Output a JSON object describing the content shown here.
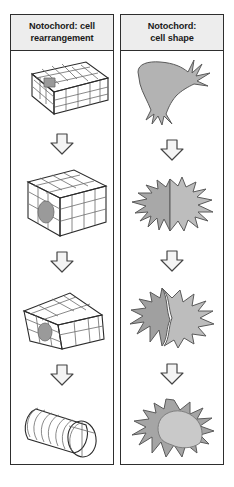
{
  "figure": {
    "background_color": "#ffffff",
    "border_color": "#2e2e2e",
    "header_fill": "#ededed"
  },
  "panels": [
    {
      "id": "cell-rearrangement",
      "header_line1": "Notochord: cell",
      "header_line2": "rearrangement",
      "stages": [
        {
          "index": 1,
          "name": "flat-wide-slab",
          "description": "Wide flat slab of many small polygonal cells, one cell shaded darker",
          "fill": "#f2f2f2",
          "top_face_fill": "#ededed",
          "side_face_fill": "#dcdcdc",
          "highlight_cell_fill": "#9a9a9a"
        },
        {
          "index": 2,
          "name": "narrow-tall-block",
          "description": "Narrower, taller block with fewer larger cells after convergent extension",
          "fill": "#f2f2f2",
          "top_face_fill": "#ededed",
          "side_face_fill": "#dcdcdc",
          "highlight_cell_fill": "#9a9a9a"
        },
        {
          "index": 3,
          "name": "tapered-wedge",
          "description": "Tapered wedge-shaped rod with large stacked cells",
          "fill": "#f2f2f2",
          "top_face_fill": "#ededed",
          "side_face_fill": "#dcdcdc",
          "highlight_cell_fill": "#9a9a9a"
        },
        {
          "index": 4,
          "name": "cylindrical-rod",
          "description": "Cylindrical notochord rod with stacked coin-like disc cells",
          "fill": "#f2f2f2",
          "top_face_fill": "#e6e6e6",
          "side_face_fill": "#d4d4d4",
          "highlight_cell_fill": "#9a9a9a"
        }
      ]
    },
    {
      "id": "cell-shape",
      "header_line1": "Notochord:",
      "header_line2": "cell shape",
      "stages": [
        {
          "index": 1,
          "name": "mesenchymal-cell",
          "description": "Elongated mesenchymal cell with spiky filopodia at both ends",
          "fill": "#b3b3b3"
        },
        {
          "index": 2,
          "name": "two-stellate-cells",
          "description": "Two adjacent star-burst cells, left darker, right lighter",
          "fill_left": "#a8a8a8",
          "fill_right": "#bdbdbd"
        },
        {
          "index": 3,
          "name": "two-stellate-cells-interdigitated",
          "description": "Two interdigitating star-burst cells with interlocking boundary",
          "fill_left": "#a0a0a0",
          "fill_right": "#bdbdbd"
        },
        {
          "index": 4,
          "name": "vacuolated-cell",
          "description": "Single large spiky cell with crescent dark cytoplasm and large pale vacuole",
          "fill": "#a5a5a5",
          "vacuole_fill": "#c9c9c9"
        }
      ]
    }
  ],
  "arrow": {
    "name": "down-block-arrow",
    "count_per_panel": 3,
    "fill": "#f4f4f4",
    "stroke": "#444444"
  }
}
